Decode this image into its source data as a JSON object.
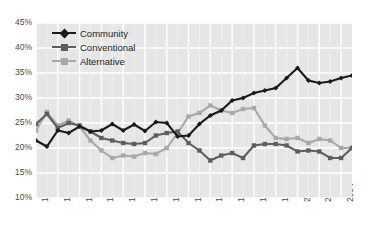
{
  "chart_data": {
    "type": "line",
    "title": "",
    "subtitle": "",
    "xlabel": "",
    "ylabel": "",
    "grid": true,
    "legend_position": "top-left",
    "ylim": [
      10,
      45
    ],
    "ytick_step": 5,
    "ytick_labels": [
      "45%",
      "40%",
      "35%",
      "30%",
      "25%",
      "20%",
      "15%",
      "10%"
    ],
    "ytick_values": [
      45,
      40,
      35,
      30,
      25,
      20,
      15,
      10
    ],
    "xlim": [
      1976,
      2005
    ],
    "xtick_labels": [
      "1976",
      "1978",
      "1980",
      "1982",
      "1984",
      "1986",
      "1988",
      "1990",
      "1992",
      "1994",
      "1996",
      "1998",
      "2000",
      "2002",
      "2004"
    ],
    "xtick_values": [
      1976,
      1978,
      1980,
      1982,
      1984,
      1986,
      1988,
      1990,
      1992,
      1994,
      1996,
      1998,
      2000,
      2002,
      2004
    ],
    "x": [
      1976,
      1977,
      1978,
      1979,
      1980,
      1981,
      1982,
      1983,
      1984,
      1985,
      1986,
      1987,
      1988,
      1989,
      1990,
      1991,
      1992,
      1993,
      1994,
      1995,
      1996,
      1997,
      1998,
      1999,
      2000,
      2001,
      2002,
      2003,
      2004,
      2005
    ],
    "series": [
      {
        "name": "Community",
        "color": "#1a1a1a",
        "marker": "diamond",
        "values": [
          21.5,
          20.3,
          23.5,
          23.0,
          24.3,
          23.3,
          23.5,
          24.8,
          23.5,
          24.7,
          23.4,
          25.2,
          25.0,
          22.3,
          22.5,
          24.8,
          26.5,
          27.5,
          29.5,
          30.0,
          31.0,
          31.5,
          32.0,
          34.0,
          36.0,
          33.5,
          33.0,
          33.3,
          34.0,
          34.5
        ]
      },
      {
        "name": "Conventional",
        "color": "#5e5e5e",
        "marker": "square",
        "values": [
          24.8,
          26.8,
          24.0,
          25.0,
          24.5,
          23.3,
          22.0,
          21.5,
          21.0,
          20.8,
          21.0,
          22.5,
          23.0,
          23.3,
          21.0,
          19.5,
          17.5,
          18.5,
          19.0,
          18.0,
          20.5,
          20.8,
          20.8,
          20.5,
          19.3,
          19.5,
          19.3,
          18.0,
          18.0,
          20.0
        ]
      },
      {
        "name": "Alternative",
        "color": "#a8a8a8",
        "marker": "square",
        "values": [
          23.5,
          27.2,
          24.5,
          25.5,
          24.3,
          21.5,
          19.5,
          18.0,
          18.5,
          18.3,
          19.0,
          18.8,
          20.0,
          23.0,
          26.3,
          27.0,
          28.5,
          27.5,
          27.0,
          27.8,
          28.0,
          24.5,
          22.0,
          21.8,
          22.0,
          21.0,
          21.8,
          21.5,
          20.0,
          20.0
        ]
      }
    ]
  },
  "legend": {
    "items": [
      {
        "label": "Community"
      },
      {
        "label": "Conventional"
      },
      {
        "label": "Alternative"
      }
    ]
  }
}
